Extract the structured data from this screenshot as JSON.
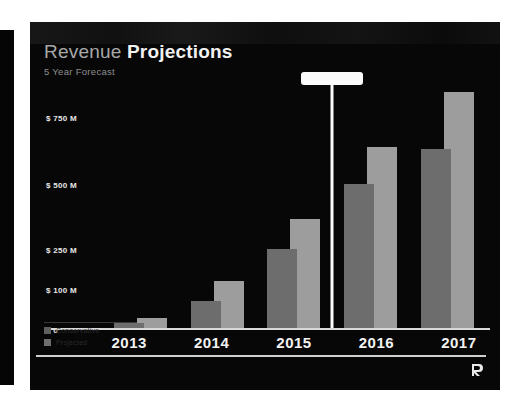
{
  "slide": {
    "title_light": "Revenue",
    "title_bold": "Projections",
    "subtitle": "5 Year Forecast",
    "background": "#070707",
    "logo_name": "R"
  },
  "legend": {
    "items": [
      {
        "label": "Conservative",
        "color": "#5f5f5f"
      },
      {
        "label": "Projected",
        "color": "#6e6e6e"
      }
    ]
  },
  "chart_data": {
    "type": "bar",
    "title": "Revenue Projections",
    "subtitle": "5 Year Forecast",
    "xlabel": "",
    "ylabel": "",
    "categories": [
      "2013",
      "2014",
      "2015",
      "2016",
      "2017"
    ],
    "ytick_labels": [
      "$ 750 M",
      "$ 500 M",
      "$ 250 M",
      "$ 100 M",
      "$ 0"
    ],
    "ytick_values": [
      750,
      500,
      250,
      100,
      0
    ],
    "ytick_positions_pct": [
      15,
      42,
      68,
      84,
      100
    ],
    "ylim": [
      0,
      800
    ],
    "grid": false,
    "legend_position": "bottom-left",
    "series": [
      {
        "name": "Conservative",
        "color": "#6d6d6d",
        "values": [
          10,
          45,
          150,
          330,
          520
        ],
        "heights_pct": [
          2,
          11,
          32,
          58,
          72
        ]
      },
      {
        "name": "Projected",
        "color": "#9d9d9d",
        "values": [
          18,
          90,
          275,
          530,
          790
        ],
        "heights_pct": [
          4,
          19,
          44,
          73,
          95
        ]
      }
    ],
    "annotations": [
      {
        "type": "tooltip-marker",
        "label": "",
        "between_categories": [
          "2015",
          "2016"
        ],
        "color": "#fbfbfb"
      }
    ]
  }
}
